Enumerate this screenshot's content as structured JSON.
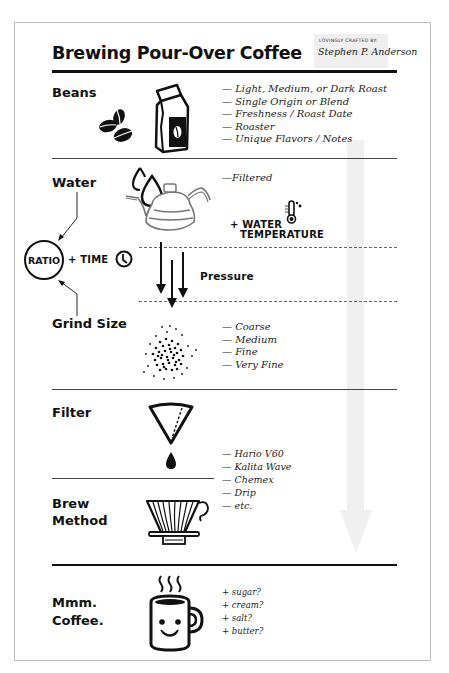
{
  "header": {
    "title": "Brewing Pour-Over Coffee",
    "credit_label": "LOVINGLY CRAFTED BY:",
    "credit_signature": "Stephen P. Anderson"
  },
  "sections": {
    "beans": {
      "label": "Beans",
      "icons": [
        "coffee-beans-icon",
        "coffee-bag-icon"
      ],
      "notes": [
        "— Light, Medium, or Dark Roast",
        "— Single Origin or Blend",
        "— Freshness / Roast Date",
        "— Roaster",
        "— Unique Flavors / Notes"
      ]
    },
    "water": {
      "label": "Water",
      "icons": [
        "water-drops-icon",
        "kettle-icon"
      ],
      "notes": [
        "—Filtered"
      ],
      "temperature_label_1": "+ WATER",
      "temperature_label_2": "TEMPERATURE",
      "temperature_icon": "thermometer-icon"
    },
    "ratio": {
      "label": "RATIO",
      "time_label": "+ TIME",
      "time_icon": "clock-icon"
    },
    "pressure": {
      "label": "Pressure",
      "icon": "down-arrows-icon"
    },
    "grind": {
      "label": "Grind Size",
      "icon": "coffee-grounds-icon",
      "notes": [
        "— Coarse",
        "— Medium",
        "— Fine",
        "— Very Fine"
      ]
    },
    "filter": {
      "label": "Filter",
      "icon": "paper-filter-icon"
    },
    "brew_method": {
      "label_1": "Brew",
      "label_2": "Method",
      "icon": "dripper-icon",
      "notes": [
        "— Hario V60",
        "— Kalita Wave",
        "— Chemex",
        "— Drip",
        "— etc."
      ]
    },
    "coffee": {
      "label_1": "Mmm.",
      "label_2": "Coffee.",
      "icon": "smiling-mug-icon",
      "notes": [
        "+ sugar?",
        "+ cream?",
        "+ salt?",
        "+ butter?"
      ]
    }
  },
  "colors": {
    "ink": "#111111",
    "credit_bg": "#efefef",
    "flow_arrow": "#f0f0f0",
    "card_border": "#bdbdbd"
  }
}
